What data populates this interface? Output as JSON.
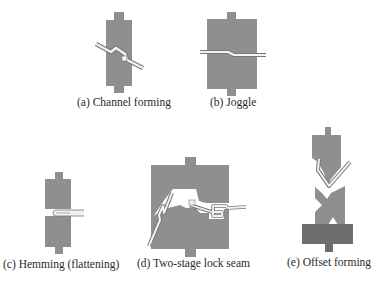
{
  "figure": {
    "colors": {
      "die": "#8f8f8f",
      "die_dark": "#6e6e6e",
      "sheet_fill": "#f2f2f2",
      "sheet_stroke": "#777777",
      "text": "#2a2a2a"
    },
    "panels": [
      {
        "id": "a",
        "label": "(a) Channel forming"
      },
      {
        "id": "b",
        "label": "(b) Joggle"
      },
      {
        "id": "c",
        "label": "(c) Hemming (flattening)"
      },
      {
        "id": "d",
        "label": "(d) Two-stage lock seam"
      },
      {
        "id": "e",
        "label": "(e) Offset forming"
      }
    ]
  }
}
